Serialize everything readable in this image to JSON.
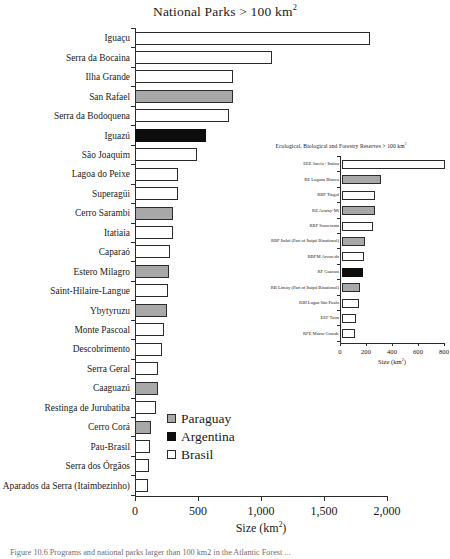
{
  "main_title_text": "National Parks > 100 km",
  "main_title_sup": "2",
  "axis_title_text": "Size (km",
  "axis_title_sup": "2",
  "axis_title_tail": ")",
  "caption_text": "Figure 10.6   Programs and national parks larger than 100 km2 in the Atlantic Forest ...",
  "legend": {
    "items": [
      {
        "label": "Paraguay",
        "key": "paraguay",
        "color": "#a8a8a8"
      },
      {
        "label": "Argentina",
        "key": "argentina",
        "color": "#0d0d0d"
      },
      {
        "label": "Brasil",
        "key": "brasil",
        "color": "#ffffff"
      }
    ]
  },
  "inset_title_text": "Ecological, Biological and Forestry Reserves > 100 km",
  "inset_title_sup": "2",
  "chart_data": [
    {
      "type": "bar",
      "orientation": "horizontal",
      "title": "National Parks > 100 km2",
      "xlabel": "Size (km2)",
      "ylabel": "",
      "xlim": [
        0,
        2000
      ],
      "xticks": [
        0,
        500,
        1000,
        1500,
        2000
      ],
      "xticklabels": [
        "0",
        "500",
        "1,000",
        "1,500",
        "2,000"
      ],
      "grid": false,
      "legend_position": "center-lower",
      "categories": [
        "Iguaçu",
        "Serra da Bocaina",
        "Ilha Grande",
        "San Rafael",
        "Serra da Bodoquena",
        "Iguazú",
        "São Joaquim",
        "Lagoa do Peixe",
        "Superagüi",
        "Cerro Sarambi",
        "Itatiaia",
        "Caparaó",
        "Estero Milagro",
        "Saint-Hilaire-Langue",
        "Ybytyruzu",
        "Monte Pascoal",
        "Descobrimento",
        "Serra Geral",
        "Caaguazú",
        "Restinga de Jurubatiba",
        "Cerro Corá",
        "Pau-Brasil",
        "Serra dos Órgãos",
        "Aparados da Serra (Itaimbezinho)"
      ],
      "values": [
        1865,
        1090,
        780,
        780,
        745,
        565,
        495,
        340,
        340,
        305,
        300,
        280,
        270,
        265,
        255,
        230,
        215,
        185,
        180,
        170,
        125,
        120,
        110,
        105
      ],
      "countries": [
        "brasil",
        "brasil",
        "brasil",
        "paraguay",
        "brasil",
        "argentina",
        "brasil",
        "brasil",
        "brasil",
        "paraguay",
        "brasil",
        "brasil",
        "paraguay",
        "brasil",
        "paraguay",
        "brasil",
        "brasil",
        "brasil",
        "paraguay",
        "brasil",
        "paraguay",
        "brasil",
        "brasil",
        "brasil"
      ]
    },
    {
      "type": "bar",
      "orientation": "horizontal",
      "title": "Ecological, Biological and Forestry Reserves > 100 km2",
      "xlabel": "Size (km2)",
      "ylabel": "",
      "xlim": [
        0,
        800
      ],
      "xticks": [
        0,
        200,
        400,
        600,
        800
      ],
      "xticklabels": [
        "0",
        "200",
        "400",
        "600",
        "800"
      ],
      "grid": false,
      "categories": [
        "EEE Jureía - Itatins",
        "RE Laguna Blanca",
        "RBF Tingol",
        "RE Acaray-Mi",
        "RBF Sooretama",
        "RBF Itabó (Part of Itaipú Binational)",
        "RBFM Arvoredo",
        "RF Guarani",
        "RB Limoy (Part of Itaipú Binational)",
        "RBI Lagoa São Paulo",
        "EEF Taim",
        "RFE Morro Grande"
      ],
      "values": [
        790,
        300,
        255,
        250,
        240,
        175,
        172,
        160,
        135,
        130,
        105,
        103
      ],
      "countries": [
        "brasil",
        "paraguay",
        "brasil",
        "paraguay",
        "brasil",
        "paraguay",
        "brasil",
        "argentina",
        "paraguay",
        "brasil",
        "brasil",
        "brasil"
      ]
    }
  ]
}
